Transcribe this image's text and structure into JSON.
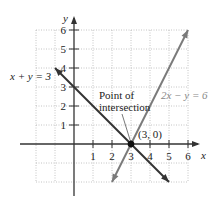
{
  "chart_data": {
    "type": "line",
    "title": "",
    "xlabel": "x",
    "ylabel": "y",
    "xlim": [
      -2,
      6
    ],
    "ylim": [
      -2,
      6
    ],
    "grid": true,
    "x_ticks": [
      "1",
      "2",
      "3",
      "4",
      "5",
      "6"
    ],
    "y_ticks": [
      "1",
      "2",
      "3",
      "4",
      "5",
      "6"
    ],
    "series": [
      {
        "name": "x + y = 3",
        "color": "#333333",
        "x": [
          -1,
          5
        ],
        "y": [
          4,
          -2
        ]
      },
      {
        "name": "2x − y = 6",
        "color": "#7a7a7a",
        "x": [
          2,
          6
        ],
        "y": [
          -2,
          6
        ]
      }
    ],
    "annotations": [
      {
        "text": "Point of",
        "text2": "intersection",
        "x": 3,
        "y": 0
      },
      {
        "text": "(3, 0)",
        "x": 3,
        "y": 0
      }
    ],
    "intersection": {
      "x": 3,
      "y": 0,
      "label": "(3, 0)"
    }
  },
  "labels": {
    "eq1": "x + y = 3",
    "eq2": "2x − y = 6",
    "point_line1": "Point of",
    "point_line2": "intersection",
    "point_coord": "(3, 0)",
    "x_axis": "x",
    "y_axis": "y"
  }
}
